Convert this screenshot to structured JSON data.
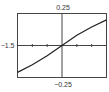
{
  "chart_data": {
    "type": "line",
    "title": "",
    "xlabel": "",
    "ylabel": "",
    "xlim": [
      -1.5,
      1.5
    ],
    "ylim": [
      -0.25,
      0.25
    ],
    "x_tick_step": 0.5,
    "grid": false,
    "legend": "none",
    "labels": {
      "ymax": "0.25",
      "ymin": "−0.25",
      "xmin": "−1.5"
    },
    "series": [
      {
        "name": "curve",
        "color": "#222222",
        "x": [
          -1.5,
          -1.0,
          -0.5,
          0.0,
          0.5,
          1.0,
          1.5
        ],
        "y": [
          -0.21,
          -0.15,
          -0.08,
          0.0,
          0.08,
          0.145,
          0.2
        ]
      }
    ]
  }
}
